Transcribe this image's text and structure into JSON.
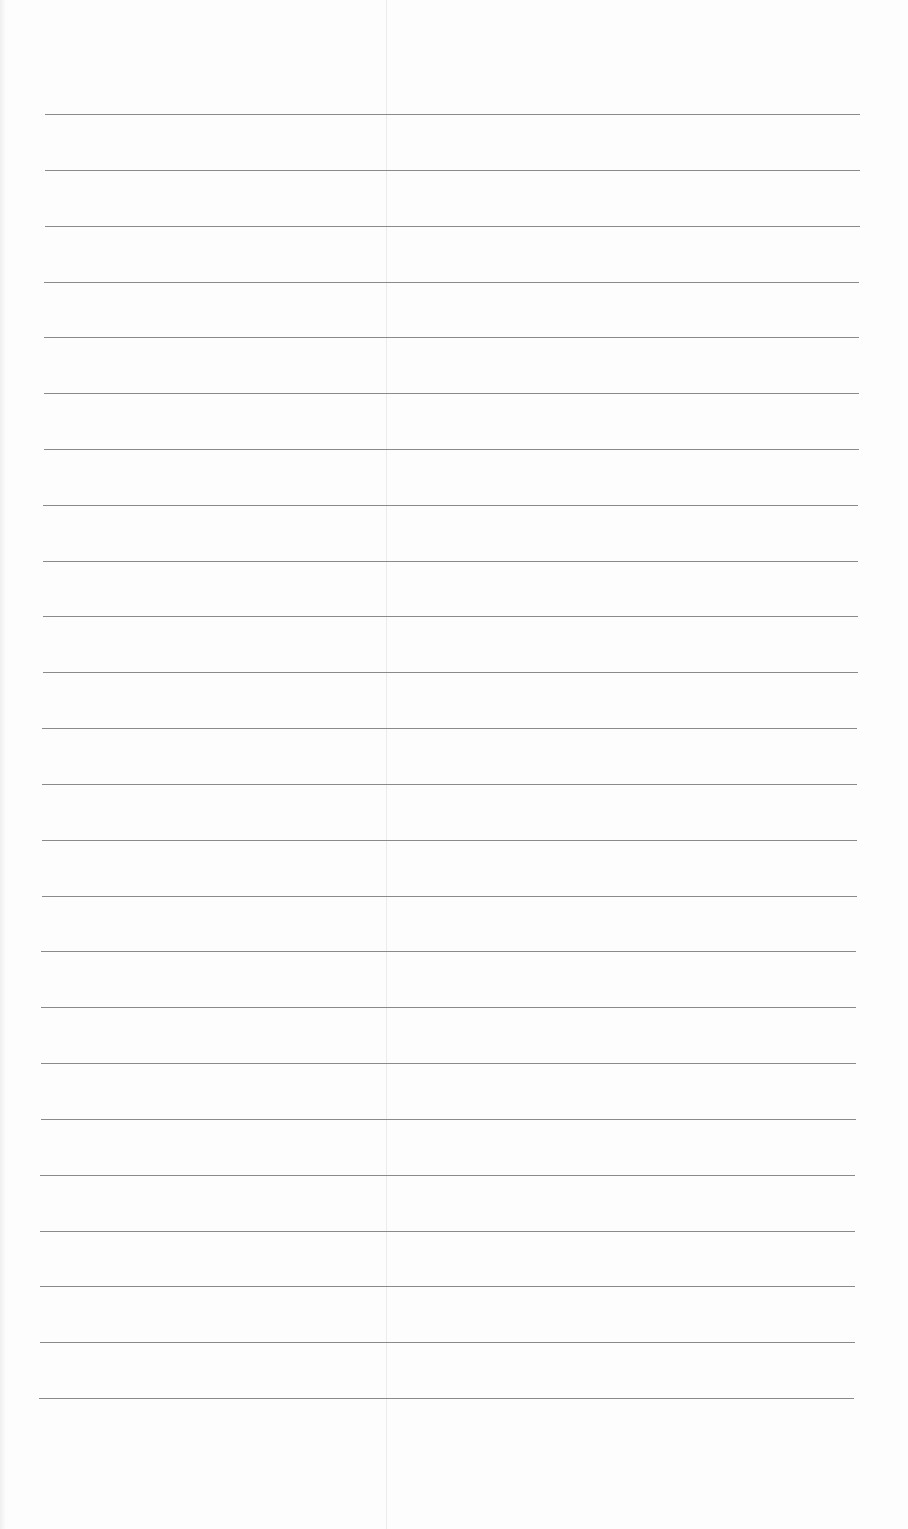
{
  "page": {
    "type": "blank lined paper",
    "line_count": 24,
    "line_color": "#8a8a8a",
    "background": "#fdfdfd"
  }
}
